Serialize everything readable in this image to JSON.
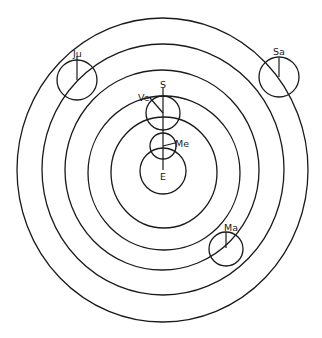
{
  "diagram": {
    "type": "geocentric planetary model with deferents and epicycles",
    "center_label": "E",
    "sun_label": "S",
    "planets": [
      {
        "key": "mercury",
        "label": "Me"
      },
      {
        "key": "venus",
        "label": "Ve"
      },
      {
        "key": "mars",
        "label": "Ma"
      },
      {
        "key": "jupiter",
        "label": "Ju"
      },
      {
        "key": "saturn",
        "label": "Sa"
      }
    ],
    "colors": {
      "line": "#1a1a1a",
      "background": "#ffffff"
    }
  }
}
